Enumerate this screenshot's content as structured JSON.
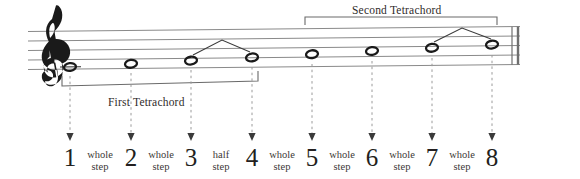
{
  "figure": {
    "clef": "treble-clef",
    "background_color": "#ffffff",
    "ink_color": "#231f20",
    "staff_line_color": "#8a8a8a",
    "leader_line_color": "#9a9a9a"
  },
  "brackets": [
    {
      "id": "first",
      "label": "First Tetrachord",
      "spans_degrees": [
        1,
        4
      ],
      "position": "below-staff"
    },
    {
      "id": "second",
      "label": "Second Tetrachord",
      "spans_degrees": [
        5,
        8
      ],
      "position": "above-staff"
    }
  ],
  "scale_degrees": [
    {
      "number": "1",
      "x": 70
    },
    {
      "number": "2",
      "x": 131
    },
    {
      "number": "3",
      "x": 191
    },
    {
      "number": "4",
      "x": 252
    },
    {
      "number": "5",
      "x": 312
    },
    {
      "number": "6",
      "x": 372
    },
    {
      "number": "7",
      "x": 432
    },
    {
      "number": "8",
      "x": 492
    }
  ],
  "intervals": [
    {
      "line1": "whole",
      "line2": "step",
      "between": [
        1,
        2
      ],
      "x": 100
    },
    {
      "line1": "whole",
      "line2": "step",
      "between": [
        2,
        3
      ],
      "x": 161
    },
    {
      "line1": "half",
      "line2": "step",
      "between": [
        3,
        4
      ],
      "x": 221
    },
    {
      "line1": "whole",
      "line2": "step",
      "between": [
        4,
        5
      ],
      "x": 282
    },
    {
      "line1": "whole",
      "line2": "step",
      "between": [
        5,
        6
      ],
      "x": 342
    },
    {
      "line1": "whole",
      "line2": "step",
      "between": [
        6,
        7
      ],
      "x": 402
    },
    {
      "line1": "whole",
      "line2": "step",
      "between": [
        7,
        8
      ],
      "x": 462
    },
    {
      "line1": "half",
      "line2": "step",
      "between": [
        8,
        8
      ],
      "x": 462
    }
  ],
  "notes": [
    {
      "degree": 1,
      "x": 70,
      "y": 67,
      "ledger": true
    },
    {
      "degree": 2,
      "x": 131,
      "y": 64,
      "ledger": false
    },
    {
      "degree": 3,
      "x": 191,
      "y": 61,
      "ledger": false
    },
    {
      "degree": 4,
      "x": 252,
      "y": 58,
      "ledger": false
    },
    {
      "degree": 5,
      "x": 312,
      "y": 55,
      "ledger": false
    },
    {
      "degree": 6,
      "x": 372,
      "y": 52,
      "ledger": false
    },
    {
      "degree": 7,
      "x": 432,
      "y": 49,
      "ledger": false
    },
    {
      "degree": 8,
      "x": 492,
      "y": 46,
      "ledger": false
    }
  ],
  "half_step_markers": [
    {
      "id": "marker-3-4",
      "from_degree": 3,
      "to_degree": 4
    },
    {
      "id": "marker-7-8",
      "from_degree": 7,
      "to_degree": 8
    }
  ]
}
